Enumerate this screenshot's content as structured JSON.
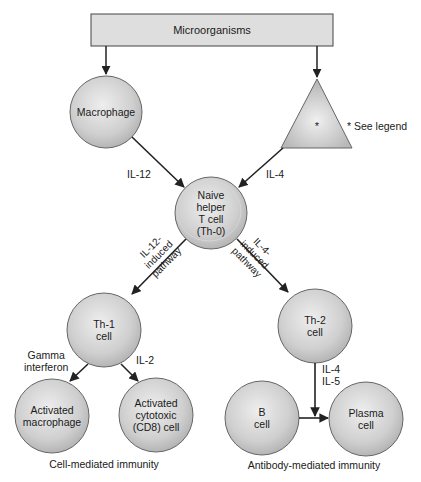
{
  "diagram": {
    "top_box": {
      "label": "Microorganisms"
    },
    "nodes": {
      "macrophage": {
        "label": "Macrophage"
      },
      "triangle": {
        "label": "*",
        "note": "* See legend"
      },
      "naive": {
        "line1": "Naive",
        "line2": "helper",
        "line3": "T cell",
        "line4": "(Th-0)"
      },
      "th1": {
        "line1": "Th-1",
        "line2": "cell"
      },
      "th2": {
        "line1": "Th-2",
        "line2": "cell"
      },
      "act_macrophage": {
        "line1": "Activated",
        "line2": "macrophage"
      },
      "act_cytotoxic": {
        "line1": "Activated",
        "line2": "cytotoxic",
        "line3": "(CD8) cell"
      },
      "b_cell": {
        "line1": "B",
        "line2": "cell"
      },
      "plasma": {
        "line1": "Plasma",
        "line2": "cell"
      }
    },
    "edge_labels": {
      "il12": "IL-12",
      "il4": "IL-4",
      "il12_path_1": "IL-12-",
      "il12_path_2": "induced",
      "il12_path_3": "pathway",
      "il4_path_1": "IL-4-",
      "il4_path_2": "induced",
      "il4_path_3": "pathway",
      "gamma_1": "Gamma",
      "gamma_2": "interferon",
      "il2": "IL-2",
      "il4_il5_1": "IL-4",
      "il4_il5_2": "IL-5"
    },
    "captions": {
      "cell_mediated": "Cell-mediated immunity",
      "antibody_mediated": "Antibody-mediated immunity"
    },
    "colors": {
      "box_fill": "#dcdcdc",
      "cell_fill": "#c8c8c8",
      "cell_highlight": "#ececec",
      "stroke": "#333333"
    }
  }
}
